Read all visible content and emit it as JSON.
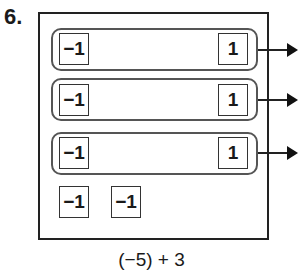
{
  "problem_number": "6.",
  "pairs": [
    {
      "negative": "−1",
      "positive": "1"
    },
    {
      "negative": "−1",
      "positive": "1"
    },
    {
      "negative": "−1",
      "positive": "1"
    }
  ],
  "leftover_tiles": [
    "−1",
    "−1"
  ],
  "expression": "(−5) + 3",
  "arrow_icon": "right-arrow"
}
